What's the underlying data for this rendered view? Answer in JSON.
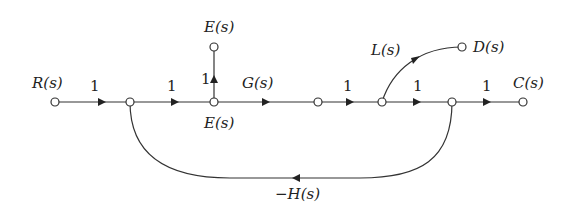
{
  "diagram": {
    "type": "signal-flow-graph",
    "nodes": [
      {
        "id": "R",
        "label": "R(s)",
        "x": 55,
        "y": 102
      },
      {
        "id": "n1",
        "label": "",
        "x": 130,
        "y": 102
      },
      {
        "id": "E",
        "label": "E(s)",
        "x": 214,
        "y": 102
      },
      {
        "id": "Eout",
        "label": "E(s)",
        "x": 214,
        "y": 47
      },
      {
        "id": "n3",
        "label": "",
        "x": 318,
        "y": 102
      },
      {
        "id": "n4",
        "label": "",
        "x": 382,
        "y": 102
      },
      {
        "id": "n5",
        "label": "",
        "x": 452,
        "y": 102
      },
      {
        "id": "C",
        "label": "C(s)",
        "x": 523,
        "y": 102
      },
      {
        "id": "D",
        "label": "D(s)",
        "x": 462,
        "y": 47
      }
    ],
    "edges": [
      {
        "from": "R",
        "to": "n1",
        "gain": "1"
      },
      {
        "from": "n1",
        "to": "E",
        "gain": "1"
      },
      {
        "from": "E",
        "to": "Eout",
        "gain": "1"
      },
      {
        "from": "E",
        "to": "n3",
        "gain": "G(s)"
      },
      {
        "from": "n3",
        "to": "n4",
        "gain": "1"
      },
      {
        "from": "D",
        "to": "n4",
        "gain": "L(s)"
      },
      {
        "from": "n4",
        "to": "n5",
        "gain": "1"
      },
      {
        "from": "n5",
        "to": "C",
        "gain": "1"
      },
      {
        "from": "n5",
        "to": "n1",
        "gain": "−H(s)"
      }
    ]
  },
  "labels": {
    "R": "R(s)",
    "E_top": "E(s)",
    "E_bottom": "E(s)",
    "C": "C(s)",
    "D": "D(s)",
    "G": "G(s)",
    "L": "L(s)",
    "H": "−H(s)",
    "gain_R_n1": "1",
    "gain_n1_E": "1",
    "gain_E_up": "1",
    "gain_n3_n4": "1",
    "gain_n4_n5": "1",
    "gain_n5_C": "1"
  }
}
